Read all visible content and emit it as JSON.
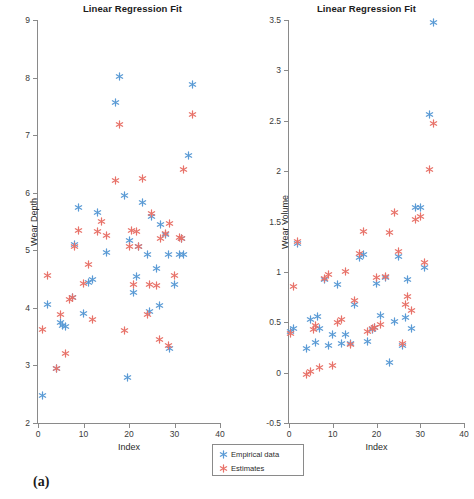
{
  "figure": {
    "subcaptions": {
      "a": "(a)",
      "b": "(b)"
    },
    "colors": {
      "empirical": "#5B9BD5",
      "estimates": "#E8736A",
      "axis": "#8a8a8a",
      "text": "#2a2a2a"
    },
    "legend": {
      "entries": [
        {
          "label": "Empirical data",
          "marker": "asterisk-icon",
          "color": "#5B9BD5"
        },
        {
          "label": "Estimates",
          "marker": "asterisk-icon",
          "color": "#E8736A"
        }
      ]
    }
  },
  "chart_data": [
    {
      "type": "scatter",
      "panel": "a",
      "title": "Linear Regression Fit",
      "xlabel": "Index",
      "ylabel": "Wear Depth",
      "xlim": [
        0,
        40
      ],
      "ylim": [
        2,
        9
      ],
      "xticks": [
        0,
        10,
        20,
        30,
        40
      ],
      "yticks": [
        2,
        3,
        4,
        5,
        6,
        7,
        8,
        9
      ],
      "grid": false,
      "legend_position": "below-right",
      "series": [
        {
          "name": "Empirical data",
          "color": "#5B9BD5",
          "marker": "*",
          "x": [
            1,
            2,
            4,
            5,
            5.4,
            6,
            7.6,
            8,
            9,
            10,
            11,
            12,
            13,
            15,
            17,
            18,
            19,
            19.6,
            20,
            21,
            21.6,
            22,
            23,
            24,
            24.4,
            25,
            26,
            26.6,
            27,
            28,
            28.6,
            29,
            30,
            31,
            31.6,
            32,
            33,
            34
          ],
          "y": [
            2.47,
            4.05,
            2.94,
            3.74,
            3.7,
            3.68,
            4.18,
            5.1,
            5.75,
            3.91,
            4.44,
            4.49,
            5.65,
            4.96,
            7.56,
            8.01,
            5.95,
            2.79,
            5.17,
            4.26,
            4.54,
            5.06,
            5.83,
            4.93,
            3.93,
            5.58,
            4.69,
            4.04,
            5.44,
            5.27,
            4.93,
            3.29,
            4.4,
            4.93,
            5.21,
            4.92,
            6.65,
            7.88
          ]
        },
        {
          "name": "Estimates",
          "color": "#E8736A",
          "marker": "*",
          "x": [
            1,
            2,
            4,
            5,
            6,
            7,
            7.6,
            8,
            9,
            10,
            11,
            12,
            13,
            14,
            15,
            17,
            18,
            19,
            20,
            20.6,
            21,
            21.6,
            22,
            23,
            24,
            24.6,
            25,
            26,
            26.6,
            27,
            28,
            28.6,
            29,
            30,
            31,
            31.6,
            32,
            34
          ],
          "y": [
            3.62,
            4.57,
            2.95,
            3.88,
            3.21,
            4.15,
            4.18,
            5.07,
            5.34,
            4.43,
            4.75,
            3.79,
            5.33,
            5.5,
            5.25,
            6.22,
            7.18,
            3.61,
            5.07,
            5.34,
            4.4,
            5.33,
            5.06,
            6.25,
            3.89,
            4.4,
            5.64,
            4.39,
            3.45,
            5.21,
            5.3,
            3.34,
            5.46,
            4.56,
            5.23,
            5.2,
            6.4,
            7.35
          ]
        }
      ]
    },
    {
      "type": "scatter",
      "panel": "b",
      "title": "Linear Regression Fit",
      "xlabel": "Index",
      "ylabel": "Wear Volume",
      "xlim": [
        0,
        40
      ],
      "ylim": [
        -0.5,
        3.5
      ],
      "xticks": [
        0,
        10,
        20,
        30,
        40
      ],
      "yticks": [
        -0.5,
        0,
        0.5,
        1,
        1.5,
        2,
        2.5,
        3,
        3.5
      ],
      "grid": false,
      "legend_position": "below-left",
      "series": [
        {
          "name": "Empirical data",
          "color": "#5B9BD5",
          "marker": "*",
          "x": [
            0.4,
            1,
            2,
            4,
            5,
            6,
            6.6,
            7,
            8,
            9,
            10,
            11,
            12,
            13,
            14,
            15,
            16,
            17,
            18,
            19,
            19.6,
            20,
            21,
            22,
            23,
            24,
            25,
            26,
            26.6,
            27,
            28,
            29,
            30,
            31,
            32,
            33
          ],
          "y": [
            0.41,
            0.44,
            1.28,
            0.24,
            0.53,
            0.3,
            0.56,
            0.44,
            0.92,
            0.27,
            0.38,
            0.87,
            0.29,
            0.38,
            0.29,
            0.68,
            1.14,
            1.17,
            0.31,
            0.43,
            0.45,
            0.88,
            0.57,
            0.94,
            0.1,
            0.51,
            1.15,
            0.27,
            0.55,
            0.92,
            0.44,
            1.64,
            1.64,
            1.04,
            2.56,
            3.48
          ]
        },
        {
          "name": "Estimates",
          "color": "#E8736A",
          "marker": "*",
          "x": [
            0.4,
            1,
            2,
            4,
            5,
            5.6,
            6,
            7,
            8,
            9,
            10,
            11,
            12,
            13,
            14,
            15,
            16,
            17,
            18,
            19,
            19.6,
            20,
            21,
            22,
            23,
            24,
            25,
            26,
            26.6,
            27,
            28,
            29,
            30,
            31,
            32,
            33
          ],
          "y": [
            0.39,
            0.85,
            1.3,
            -0.02,
            0.01,
            0.43,
            0.47,
            0.05,
            0.93,
            0.97,
            0.07,
            0.5,
            0.53,
            1.0,
            0.28,
            0.72,
            1.18,
            1.4,
            0.41,
            0.44,
            0.45,
            0.94,
            0.48,
            0.95,
            1.39,
            1.59,
            1.2,
            0.29,
            0.68,
            0.76,
            0.62,
            1.52,
            1.55,
            1.09,
            2.02,
            2.47
          ]
        }
      ]
    }
  ]
}
